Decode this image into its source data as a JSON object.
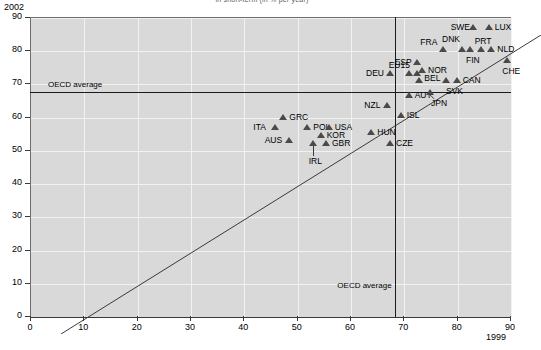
{
  "chart_data": {
    "type": "scatter",
    "title": "in short-term (in % per year)",
    "xlabel": "1999",
    "ylabel": "2002",
    "xlim": [
      0,
      90
    ],
    "ylim": [
      0,
      90
    ],
    "xticks": [
      0,
      10,
      20,
      30,
      40,
      50,
      60,
      70,
      80,
      90
    ],
    "yticks": [
      0,
      10,
      20,
      30,
      40,
      50,
      60,
      70,
      80,
      90
    ],
    "grid": true,
    "legend": "none",
    "annotations": [
      {
        "name": "oecd-average-horizontal",
        "label": "OECD average",
        "value": 67.5,
        "axis": "y"
      },
      {
        "name": "oecd-average-vertical",
        "label": "OECD average",
        "value": 68.5,
        "axis": "x"
      },
      {
        "name": "diagonal-45",
        "label": "",
        "from": [
          0,
          0
        ],
        "to": [
          90,
          90
        ]
      }
    ],
    "points": [
      {
        "label": "ITA",
        "x": 46.0,
        "y": 57.0,
        "lx": -22,
        "ly": -4
      },
      {
        "label": "GRC",
        "x": 47.5,
        "y": 60.0,
        "lx": 6,
        "ly": -4
      },
      {
        "label": "AUS",
        "x": 48.5,
        "y": 53.0,
        "lx": -24,
        "ly": -4
      },
      {
        "label": "POL",
        "x": 52.0,
        "y": 57.0,
        "lx": 6,
        "ly": -4
      },
      {
        "label": "IRL",
        "x": 53.0,
        "y": 52.0,
        "lx": -4,
        "ly": 14
      },
      {
        "label": "KOR",
        "x": 54.5,
        "y": 54.5,
        "lx": 6,
        "ly": -4
      },
      {
        "label": "GBR",
        "x": 55.5,
        "y": 52.0,
        "lx": 6,
        "ly": -4
      },
      {
        "label": "USA",
        "x": 56.0,
        "y": 57.0,
        "lx": 6,
        "ly": -4
      },
      {
        "label": "HUN",
        "x": 64.0,
        "y": 55.5,
        "lx": 6,
        "ly": -4
      },
      {
        "label": "NZL",
        "x": 67.0,
        "y": 63.5,
        "lx": -23,
        "ly": -4
      },
      {
        "label": "DEU",
        "x": 67.5,
        "y": 73.0,
        "lx": -24,
        "ly": -4
      },
      {
        "label": "CZE",
        "x": 67.5,
        "y": 52.0,
        "lx": 6,
        "ly": -4
      },
      {
        "label": "ISL",
        "x": 69.5,
        "y": 60.5,
        "lx": 6,
        "ly": -4
      },
      {
        "label": "AUT",
        "x": 71.0,
        "y": 66.5,
        "lx": 6,
        "ly": -4
      },
      {
        "label": "EU15",
        "x": 71.0,
        "y": 73.0,
        "lx": -20,
        "ly": -12
      },
      {
        "label": "",
        "x": 72.5,
        "y": 73.0,
        "lx": 0,
        "ly": 0
      },
      {
        "label": "ESP",
        "x": 72.5,
        "y": 76.5,
        "lx": -22,
        "ly": -4
      },
      {
        "label": "BEL",
        "x": 73.0,
        "y": 71.0,
        "lx": 5,
        "ly": -6
      },
      {
        "label": "NOR",
        "x": 73.5,
        "y": 74.0,
        "lx": 6,
        "ly": -4
      },
      {
        "label": "JPN",
        "x": 75.0,
        "y": 67.5,
        "lx": 1,
        "ly": 7
      },
      {
        "label": "FRA",
        "x": 77.5,
        "y": 80.5,
        "lx": -23,
        "ly": -11
      },
      {
        "label": "SVK",
        "x": 78.0,
        "y": 71.0,
        "lx": 0,
        "ly": 7
      },
      {
        "label": "CAN",
        "x": 80.0,
        "y": 71.0,
        "lx": 6,
        "ly": -4
      },
      {
        "label": "DNK",
        "x": 81.0,
        "y": 80.5,
        "lx": -20,
        "ly": -14
      },
      {
        "label": "FIN",
        "x": 82.5,
        "y": 80.5,
        "lx": -4,
        "ly": 7
      },
      {
        "label": "SWE",
        "x": 83.0,
        "y": 87.0,
        "lx": -22,
        "ly": -4
      },
      {
        "label": "PRT",
        "x": 84.5,
        "y": 80.5,
        "lx": -6,
        "ly": -12
      },
      {
        "label": "LUX",
        "x": 86.0,
        "y": 87.0,
        "lx": 6,
        "ly": -4
      },
      {
        "label": "NLD",
        "x": 86.5,
        "y": 80.5,
        "lx": 6,
        "ly": -4
      },
      {
        "label": "CHE",
        "x": 89.5,
        "y": 77.0,
        "lx": -5,
        "ly": 7
      }
    ]
  },
  "axes": {
    "y_unit_label": "2002",
    "x_unit_label": "1999"
  },
  "colors": {
    "plot_background": "#d9d9d9",
    "gridline": "#f2f2f2",
    "marker": "#4a4a4a",
    "reference_line": "#1a1a1a",
    "axis": "#3a3a3a"
  }
}
